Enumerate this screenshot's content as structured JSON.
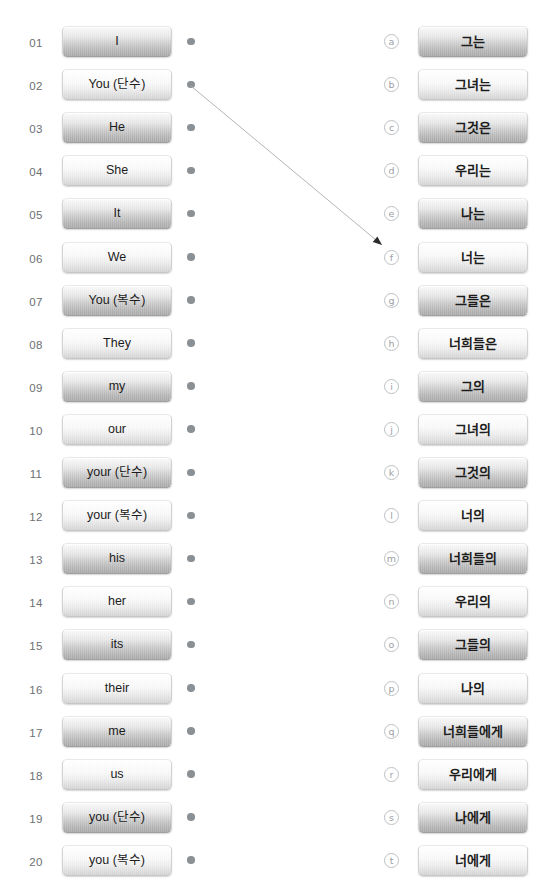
{
  "exercise": {
    "title": "English pronoun to Korean matching exercise",
    "left_column_count": 20,
    "right_column_count": 20
  },
  "colors": {
    "index_text": "#6c7073",
    "dot": "#8b9094",
    "marker_border": "#bdc1c4",
    "marker_text": "#9ba0a4",
    "connector_line": "#b5b5b5",
    "arrowhead": "#2b2b2b",
    "button_text": "#1c1c1c",
    "page_background": "#ffffff"
  },
  "left_items": [
    {
      "num": "01",
      "label": "I",
      "shade": "dark"
    },
    {
      "num": "02",
      "label": "You (단수)",
      "shade": "light"
    },
    {
      "num": "03",
      "label": "He",
      "shade": "dark"
    },
    {
      "num": "04",
      "label": "She",
      "shade": "light"
    },
    {
      "num": "05",
      "label": "It",
      "shade": "dark"
    },
    {
      "num": "06",
      "label": "We",
      "shade": "light"
    },
    {
      "num": "07",
      "label": "You (복수)",
      "shade": "dark"
    },
    {
      "num": "08",
      "label": "They",
      "shade": "light"
    },
    {
      "num": "09",
      "label": "my",
      "shade": "dark"
    },
    {
      "num": "10",
      "label": "our",
      "shade": "light"
    },
    {
      "num": "11",
      "label": "your (단수)",
      "shade": "dark"
    },
    {
      "num": "12",
      "label": "your (복수)",
      "shade": "light"
    },
    {
      "num": "13",
      "label": "his",
      "shade": "dark"
    },
    {
      "num": "14",
      "label": "her",
      "shade": "light"
    },
    {
      "num": "15",
      "label": "its",
      "shade": "dark"
    },
    {
      "num": "16",
      "label": "their",
      "shade": "light"
    },
    {
      "num": "17",
      "label": "me",
      "shade": "dark"
    },
    {
      "num": "18",
      "label": "us",
      "shade": "light"
    },
    {
      "num": "19",
      "label": "you (단수)",
      "shade": "dark"
    },
    {
      "num": "20",
      "label": "you (복수)",
      "shade": "light"
    }
  ],
  "right_items": [
    {
      "marker": "ⓐ",
      "letter": "a",
      "label": "그는",
      "shade": "dark"
    },
    {
      "marker": "ⓑ",
      "letter": "b",
      "label": "그녀는",
      "shade": "light"
    },
    {
      "marker": "ⓒ",
      "letter": "c",
      "label": "그것은",
      "shade": "dark"
    },
    {
      "marker": "ⓓ",
      "letter": "d",
      "label": "우리는",
      "shade": "light"
    },
    {
      "marker": "ⓔ",
      "letter": "e",
      "label": "나는",
      "shade": "dark"
    },
    {
      "marker": "ⓕ",
      "letter": "f",
      "label": "너는",
      "shade": "light"
    },
    {
      "marker": "ⓖ",
      "letter": "g",
      "label": "그들은",
      "shade": "dark"
    },
    {
      "marker": "ⓗ",
      "letter": "h",
      "label": "너희들은",
      "shade": "light"
    },
    {
      "marker": "ⓘ",
      "letter": "i",
      "label": "그의",
      "shade": "dark"
    },
    {
      "marker": "ⓙ",
      "letter": "j",
      "label": "그녀의",
      "shade": "light"
    },
    {
      "marker": "ⓚ",
      "letter": "k",
      "label": "그것의",
      "shade": "dark"
    },
    {
      "marker": "ⓛ",
      "letter": "l",
      "label": "너의",
      "shade": "light"
    },
    {
      "marker": "ⓜ",
      "letter": "m",
      "label": "너희들의",
      "shade": "dark"
    },
    {
      "marker": "ⓝ",
      "letter": "n",
      "label": "우리의",
      "shade": "light"
    },
    {
      "marker": "ⓞ",
      "letter": "o",
      "label": "그들의",
      "shade": "dark"
    },
    {
      "marker": "ⓟ",
      "letter": "p",
      "label": "나의",
      "shade": "light"
    },
    {
      "marker": "ⓠ",
      "letter": "q",
      "label": "너희들에게",
      "shade": "dark"
    },
    {
      "marker": "ⓡ",
      "letter": "r",
      "label": "우리에게",
      "shade": "light"
    },
    {
      "marker": "ⓢ",
      "letter": "s",
      "label": "나에게",
      "shade": "dark"
    },
    {
      "marker": "ⓣ",
      "letter": "t",
      "label": "너에게",
      "shade": "light"
    }
  ],
  "connections": [
    {
      "from_index": "02",
      "from_label": "You (단수)",
      "to_letter": "f",
      "to_label": "너는",
      "x1": 191,
      "y1": 86,
      "x2": 382,
      "y2": 245
    }
  ]
}
